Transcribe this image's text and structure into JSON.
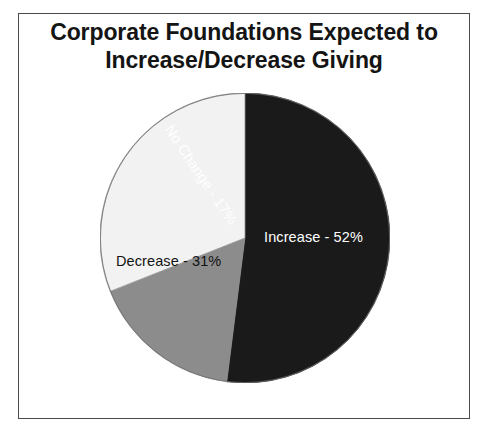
{
  "figure": {
    "border_color": "#4a4a4a",
    "background": "#ffffff"
  },
  "title": {
    "line1": "Corporate Foundations Expected to",
    "line2": "Increase/Decrease Giving"
  },
  "labels": {
    "increase": "Increase - 52%",
    "decrease": "Decrease - 31%",
    "no_change": "No Change - 17%"
  },
  "chart_data": {
    "type": "pie",
    "title": "Corporate Foundations Expected to Increase/Decrease Giving",
    "xlabel": "",
    "ylabel": "",
    "legend_position": "none",
    "grid": false,
    "units": "percent",
    "start_angle_deg": 0,
    "direction": "clockwise",
    "categories": [
      "Increase",
      "No Change",
      "Decrease"
    ],
    "values": [
      52,
      17,
      31
    ],
    "colors": [
      "#1a1a1a",
      "#8c8c8c",
      "#f2f2f2"
    ],
    "label_colors": [
      "#ffffff",
      "#ffffff",
      "#121212"
    ],
    "slices": [
      {
        "name": "Increase",
        "value": 52,
        "label": "Increase - 52%",
        "color": "#1a1a1a",
        "start_deg": 0,
        "end_deg": 187.2
      },
      {
        "name": "No Change",
        "value": 17,
        "label": "No Change - 17%",
        "color": "#8c8c8c",
        "start_deg": 187.2,
        "end_deg": 248.4
      },
      {
        "name": "Decrease",
        "value": 31,
        "label": "Decrease - 31%",
        "color": "#f2f2f2",
        "start_deg": 248.4,
        "end_deg": 360
      }
    ]
  }
}
